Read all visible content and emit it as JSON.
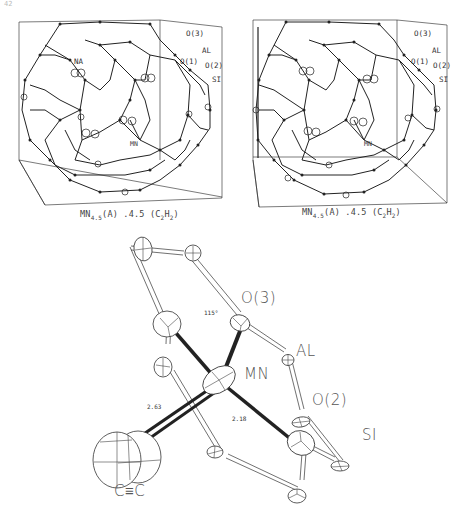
{
  "page": {
    "number": "42"
  },
  "panels": [
    {
      "id": "left-stereo",
      "labels": {
        "o3": "O(3)",
        "al": "AL",
        "o1": "O(1)",
        "o2": "O(2)",
        "si": "SI",
        "na": "NA",
        "mn": "MN"
      },
      "caption": {
        "prefix": "MN",
        "sub1": "4.5",
        "middle": "(A) .4.5 (C",
        "sub2": "2",
        "h": "H",
        "sub3": "2",
        "end": ")"
      }
    },
    {
      "id": "right-stereo",
      "labels": {
        "o3": "O(3)",
        "al": "AL",
        "o1": "O(1)",
        "o2": "O(2)",
        "si": "SI",
        "mn": "MN"
      },
      "caption": {
        "prefix": "MN",
        "sub1": "4.5",
        "middle": "(A) .4.5 (C",
        "sub2": "2",
        "h": "H",
        "sub3": "2",
        "end": ")"
      }
    }
  ],
  "detail": {
    "labels": {
      "o3": "O(3)",
      "al": "AL",
      "mn": "MN",
      "o2": "O(2)",
      "si": "SI",
      "ctc": "C≡C"
    },
    "measurements": {
      "angle": "115°",
      "dist_cc": "2.63",
      "dist_si": "2.18"
    }
  },
  "colors": {
    "ink": "#222222",
    "label": "#444444",
    "background": "#ffffff"
  }
}
